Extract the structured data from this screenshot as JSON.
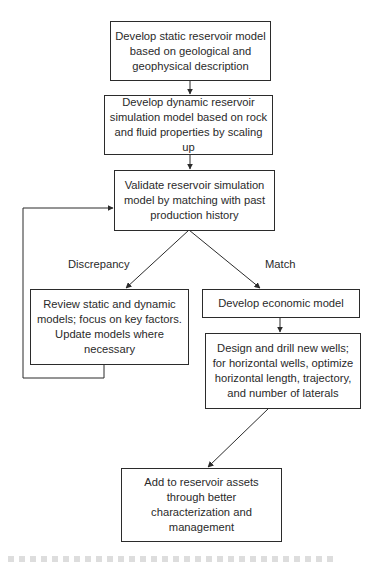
{
  "diagram": {
    "type": "flowchart",
    "nodes": {
      "static_model": {
        "label": "Develop static reservoir model\nbased on geological and\ngeophysical description"
      },
      "dynamic_model": {
        "label": "Develop dynamic reservoir\nsimulation model based on rock\nand fluid properties by scaling up"
      },
      "validate": {
        "label": "Validate reservoir simulation\nmodel by matching with past\nproduction history"
      },
      "review": {
        "label": "Review static and dynamic\nmodels; focus on key factors.\nUpdate models where\nnecessary"
      },
      "economic": {
        "label": "Develop economic model"
      },
      "design_wells": {
        "label": "Design and drill new wells;\nfor horizontal wells, optimize\nhorizontal length, trajectory,\nand number of laterals"
      },
      "add_assets": {
        "label": "Add to reservoir assets\nthrough better\ncharacterization and\nmanagement"
      }
    },
    "edge_labels": {
      "discrepancy": "Discrepancy",
      "match": "Match"
    },
    "edges": [
      {
        "from": "static_model",
        "to": "dynamic_model"
      },
      {
        "from": "dynamic_model",
        "to": "validate"
      },
      {
        "from": "validate",
        "to": "review",
        "label": "Discrepancy"
      },
      {
        "from": "validate",
        "to": "economic",
        "label": "Match"
      },
      {
        "from": "review",
        "to": "validate",
        "kind": "feedback-loop"
      },
      {
        "from": "economic",
        "to": "design_wells"
      },
      {
        "from": "design_wells",
        "to": "add_assets"
      }
    ],
    "colors": {
      "stroke": "#2b2b2b",
      "text": "#2a2a2a",
      "background": "#ffffff"
    }
  }
}
